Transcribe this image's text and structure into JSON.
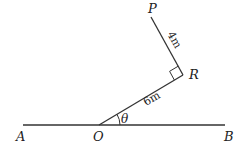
{
  "diagram": {
    "points": {
      "A": "A",
      "O": "O",
      "B": "B",
      "R": "R",
      "P": "P"
    },
    "segments": {
      "OR_length": "6m",
      "RP_length": "4m"
    },
    "angle_label": "θ",
    "right_angle_at": "R"
  }
}
